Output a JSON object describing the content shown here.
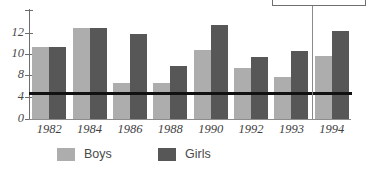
{
  "chart_data": {
    "type": "bar",
    "title": "",
    "subtitle": "",
    "xlabel": "",
    "ylabel": "",
    "categories": [
      "1982",
      "1984",
      "1986",
      "1988",
      "1990",
      "1992",
      "1993",
      "1994"
    ],
    "series": [
      {
        "name": "Boys",
        "color": "#adadad",
        "values": [
          10.8,
          12.6,
          6.8,
          6.8,
          10.5,
          8.8,
          7.9,
          9.9
        ]
      },
      {
        "name": "Girls",
        "color": "#575757",
        "values": [
          10.8,
          12.6,
          12.0,
          9.0,
          12.9,
          9.8,
          10.4,
          12.3
        ]
      }
    ],
    "ytick_labels": [
      "0",
      "4",
      "8",
      "10",
      "12"
    ],
    "ytick_values": [
      0,
      4,
      8,
      10,
      12
    ],
    "ylim": [
      0,
      13.2
    ],
    "axis_note": "non-uniform y-axis: spacing between 4 and 8 is compressed to one step",
    "grid": false,
    "legend_position": "bottom",
    "annotations": [
      {
        "name": "reference-line",
        "kind": "horizontal-line",
        "value": 4.7,
        "color": "#111111"
      },
      {
        "name": "callout-leader",
        "kind": "vertical-line",
        "at_category_boundary_after": "1993",
        "color": "#8a8a8a"
      },
      {
        "name": "callout-box",
        "kind": "rectangle",
        "label": "",
        "color": "#6f6f6f"
      }
    ]
  },
  "legend": {
    "items": [
      {
        "label": "Boys",
        "color": "#adadad"
      },
      {
        "label": "Girls",
        "color": "#575757"
      }
    ]
  },
  "axis": {
    "y_labels": [
      "12",
      "10",
      "8",
      "4",
      "0"
    ]
  }
}
